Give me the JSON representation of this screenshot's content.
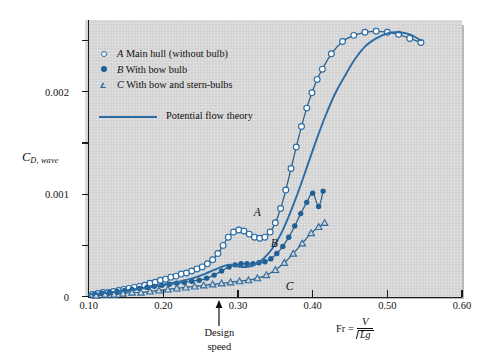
{
  "figure": {
    "panel_background": "#d2d2d2",
    "accent_color": "#2a6ba4",
    "marker_fill_color": "#1e5f96"
  },
  "axes": {
    "y_title_main": "C",
    "y_title_sub": "D, wave",
    "y_ticks_labeled": [
      "0",
      "0.001",
      "0.002"
    ],
    "y_tick_values": [
      0,
      0.001,
      0.002
    ],
    "y_minor_values": [
      0.0005,
      0.0015,
      0.0025
    ],
    "x_ticks_labeled": [
      "0.10",
      "0.20",
      "0.30",
      "0.40",
      "0.50",
      "0.60"
    ],
    "x_tick_values": [
      0.1,
      0.2,
      0.3,
      0.4,
      0.5,
      0.6
    ],
    "x_title_lhs": "Fr =",
    "x_title_numerator": "V",
    "x_title_denominator": "Lg",
    "x_title_radical": "√"
  },
  "annotations": {
    "design_speed_line1": "Design",
    "design_speed_line2": "speed",
    "design_speed_fr": 0.275,
    "curve_label_a": "A",
    "curve_label_b": "B",
    "curve_label_c": "C"
  },
  "legend": {
    "items": [
      {
        "marker": "open-circle-icon",
        "series": "A",
        "label": "Main hull (without bulb)"
      },
      {
        "marker": "filled-circle-icon",
        "series": "B",
        "label": "With bow bulb"
      },
      {
        "marker": "open-triangle-icon",
        "series": "C",
        "label": "With bow and stern-bulbs"
      }
    ],
    "line_entry": {
      "marker": "solid-line-icon",
      "label": "Potential flow theory"
    }
  },
  "chart_data": {
    "type": "line",
    "title": "",
    "xlabel": "Fr = V / sqrt(Lg)",
    "ylabel": "C_D,wave",
    "xlim": [
      0.1,
      0.6
    ],
    "ylim": [
      0,
      0.0027
    ],
    "grid": false,
    "legend_position": "upper-left-inside",
    "series": [
      {
        "name": "A Main hull (without bulb)",
        "marker": "open-circle",
        "x": [
          0.105,
          0.112,
          0.119,
          0.126,
          0.133,
          0.14,
          0.147,
          0.154,
          0.161,
          0.168,
          0.175,
          0.182,
          0.189,
          0.196,
          0.203,
          0.21,
          0.217,
          0.224,
          0.231,
          0.238,
          0.245,
          0.252,
          0.259,
          0.266,
          0.273,
          0.28,
          0.287,
          0.294,
          0.301,
          0.308,
          0.315,
          0.322,
          0.329,
          0.336,
          0.343,
          0.35,
          0.357,
          0.364,
          0.371,
          0.378,
          0.385,
          0.392,
          0.399,
          0.406,
          0.413,
          0.425,
          0.44,
          0.455,
          0.47,
          0.485,
          0.5,
          0.515,
          0.53,
          0.545
        ],
        "y": [
          2e-05,
          3e-05,
          4e-05,
          4e-05,
          5e-05,
          6e-05,
          7e-05,
          8e-05,
          9e-05,
          0.0001,
          0.00011,
          0.00013,
          0.00014,
          0.00016,
          0.00017,
          0.00019,
          0.0002,
          0.00022,
          0.00023,
          0.00025,
          0.00027,
          0.00029,
          0.00032,
          0.00036,
          0.00042,
          0.0005,
          0.00058,
          0.00063,
          0.00065,
          0.00064,
          0.00061,
          0.00058,
          0.00057,
          0.00058,
          0.00063,
          0.00072,
          0.00086,
          0.00104,
          0.00125,
          0.00146,
          0.00166,
          0.00184,
          0.00199,
          0.00212,
          0.00222,
          0.00237,
          0.00249,
          0.00255,
          0.00258,
          0.00259,
          0.00258,
          0.00256,
          0.00252,
          0.00248
        ]
      },
      {
        "name": "B With bow bulb",
        "marker": "filled-circle",
        "x": [
          0.108,
          0.118,
          0.128,
          0.138,
          0.148,
          0.158,
          0.168,
          0.178,
          0.188,
          0.198,
          0.208,
          0.218,
          0.228,
          0.238,
          0.248,
          0.258,
          0.268,
          0.278,
          0.288,
          0.296,
          0.304,
          0.312,
          0.32,
          0.328,
          0.336,
          0.344,
          0.352,
          0.36,
          0.368,
          0.376,
          0.384,
          0.392,
          0.4,
          0.408,
          0.414
        ],
        "y": [
          2e-05,
          3e-05,
          4e-05,
          5e-05,
          6e-05,
          7e-05,
          8e-05,
          9e-05,
          0.0001,
          0.00011,
          0.00012,
          0.00013,
          0.00014,
          0.00015,
          0.00016,
          0.00018,
          0.00021,
          0.00025,
          0.00029,
          0.00031,
          0.00032,
          0.00032,
          0.00032,
          0.00033,
          0.00034,
          0.00037,
          0.00042,
          0.00049,
          0.00058,
          0.00069,
          0.00081,
          0.00092,
          0.00101,
          0.00088,
          0.00103
        ]
      },
      {
        "name": "C With bow and stern-bulbs",
        "marker": "open-triangle",
        "x": [
          0.11,
          0.122,
          0.134,
          0.146,
          0.158,
          0.17,
          0.182,
          0.194,
          0.206,
          0.218,
          0.23,
          0.242,
          0.254,
          0.266,
          0.278,
          0.29,
          0.302,
          0.314,
          0.326,
          0.338,
          0.35,
          0.362,
          0.374,
          0.386,
          0.398,
          0.408,
          0.416
        ],
        "y": [
          1e-05,
          2e-05,
          2e-05,
          3e-05,
          4e-05,
          4e-05,
          5e-05,
          6e-05,
          7e-05,
          8e-05,
          9e-05,
          0.0001,
          0.00011,
          0.00012,
          0.00013,
          0.00014,
          0.00015,
          0.00016,
          0.00018,
          0.00021,
          0.00026,
          0.00033,
          0.00042,
          0.00052,
          0.00062,
          0.00068,
          0.00072
        ]
      },
      {
        "name": "Potential flow theory",
        "marker": "none",
        "x": [
          0.1,
          0.14,
          0.18,
          0.21,
          0.235,
          0.255,
          0.268,
          0.278,
          0.286,
          0.292,
          0.298,
          0.304,
          0.312,
          0.322,
          0.334,
          0.346,
          0.358,
          0.37,
          0.382,
          0.394,
          0.406,
          0.418,
          0.43,
          0.442,
          0.455,
          0.47,
          0.485,
          0.5,
          0.515,
          0.53,
          0.545
        ],
        "y": [
          2e-05,
          5e-05,
          9e-05,
          0.00013,
          0.00017,
          0.00022,
          0.00026,
          0.00029,
          0.00031,
          0.00031,
          0.0003,
          0.00029,
          0.00029,
          0.00031,
          0.00037,
          0.00047,
          0.00062,
          0.00082,
          0.00105,
          0.0013,
          0.00155,
          0.00178,
          0.00198,
          0.00214,
          0.0023,
          0.00244,
          0.00252,
          0.00257,
          0.00258,
          0.00256,
          0.0025
        ]
      }
    ]
  }
}
